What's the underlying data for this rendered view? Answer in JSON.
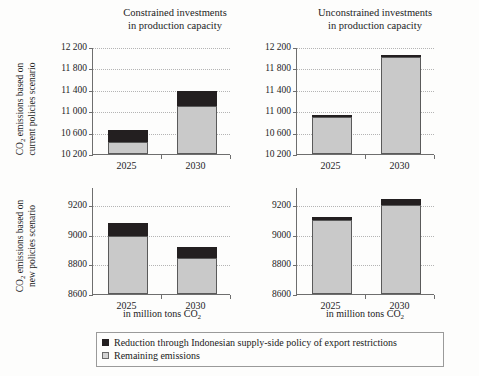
{
  "figure": {
    "background": "#fdfdfc",
    "colors": {
      "reduction": "#231f20",
      "remaining": "#c9c9c9",
      "axis": "#6e6e6e",
      "grid": "#b4b4b4"
    }
  },
  "panel_titles": {
    "left": "Constrained investments\nin production capacity",
    "right": "Unconstrained investments\nin production capacity"
  },
  "row_labels": {
    "top": "CO2 emissions based on\ncurrent policies scenario",
    "bottom": "CO2 emissions based on\nnew policies scenario"
  },
  "axis_titles": {
    "x_left": "in million tons CO",
    "x_left_sub": "2",
    "x_right": "in million tons CO",
    "x_right_sub": "2"
  },
  "legend": {
    "items": [
      {
        "label": "Reduction through Indonesian supply-side policy of export restrictions",
        "color": "#231f20",
        "swatch": "dark"
      },
      {
        "label": "Remaining emissions",
        "color": "#d2d2d2",
        "swatch": "light"
      }
    ]
  },
  "chart_data": [
    {
      "id": "top-left",
      "type": "bar",
      "stacked": true,
      "title": "Constrained investments in production capacity",
      "row": "CO2 emissions based on current policies scenario",
      "xlabel": "in million tons CO2",
      "ylabel": "",
      "categories": [
        "2025",
        "2030"
      ],
      "ylim": [
        10200,
        12200
      ],
      "yticks": [
        10200,
        10600,
        11000,
        11400,
        11800,
        12200
      ],
      "ytick_labels": [
        "10 200",
        "10 600",
        "11 000",
        "11 400",
        "11 800",
        "12 200"
      ],
      "grid": true,
      "series": [
        {
          "name": "Remaining emissions",
          "color": "#c9c9c9",
          "values": [
            10420,
            11100
          ]
        },
        {
          "name": "Reduction through Indonesian supply-side policy of export restrictions",
          "color": "#231f20",
          "values": [
            220,
            280
          ]
        }
      ],
      "totals": [
        10640,
        11380
      ]
    },
    {
      "id": "top-right",
      "type": "bar",
      "stacked": true,
      "title": "Unconstrained investments in production capacity",
      "row": "CO2 emissions based on current policies scenario",
      "xlabel": "in million tons CO2",
      "ylabel": "",
      "categories": [
        "2025",
        "2030"
      ],
      "ylim": [
        10200,
        12200
      ],
      "yticks": [
        10200,
        10600,
        11000,
        11400,
        11800,
        12200
      ],
      "ytick_labels": [
        "10 200",
        "10 600",
        "11 000",
        "11 400",
        "11 800",
        "12 200"
      ],
      "grid": true,
      "series": [
        {
          "name": "Remaining emissions",
          "color": "#c9c9c9",
          "values": [
            10900,
            12020
          ]
        },
        {
          "name": "Reduction through Indonesian supply-side policy of export restrictions",
          "color": "#231f20",
          "values": [
            30,
            40
          ]
        }
      ],
      "totals": [
        10930,
        12060
      ]
    },
    {
      "id": "bottom-left",
      "type": "bar",
      "stacked": true,
      "title": "Constrained investments in production capacity",
      "row": "CO2 emissions based on new policies scenario",
      "xlabel": "in million tons CO2",
      "ylabel": "",
      "categories": [
        "2025",
        "2030"
      ],
      "ylim": [
        8600,
        9320
      ],
      "yticks": [
        8600,
        8800,
        9000,
        9200
      ],
      "ytick_labels": [
        "8600",
        "8800",
        "9000",
        "9200"
      ],
      "grid": true,
      "series": [
        {
          "name": "Remaining emissions",
          "color": "#c9c9c9",
          "values": [
            8990,
            8840
          ]
        },
        {
          "name": "Reduction through Indonesian supply-side policy of export restrictions",
          "color": "#231f20",
          "values": [
            90,
            75
          ]
        }
      ],
      "totals": [
        9080,
        8915
      ]
    },
    {
      "id": "bottom-right",
      "type": "bar",
      "stacked": true,
      "title": "Unconstrained investments in production capacity",
      "row": "CO2 emissions based on new policies scenario",
      "xlabel": "in million tons CO2",
      "ylabel": "",
      "categories": [
        "2025",
        "2030"
      ],
      "ylim": [
        8600,
        9320
      ],
      "yticks": [
        8600,
        8800,
        9000,
        9200
      ],
      "ytick_labels": [
        "8600",
        "8800",
        "9000",
        "9200"
      ],
      "grid": true,
      "series": [
        {
          "name": "Remaining emissions",
          "color": "#c9c9c9",
          "values": [
            9095,
            9200
          ]
        },
        {
          "name": "Reduction through Indonesian supply-side policy of export restrictions",
          "color": "#231f20",
          "values": [
            25,
            40
          ]
        }
      ],
      "totals": [
        9120,
        9240
      ]
    }
  ]
}
